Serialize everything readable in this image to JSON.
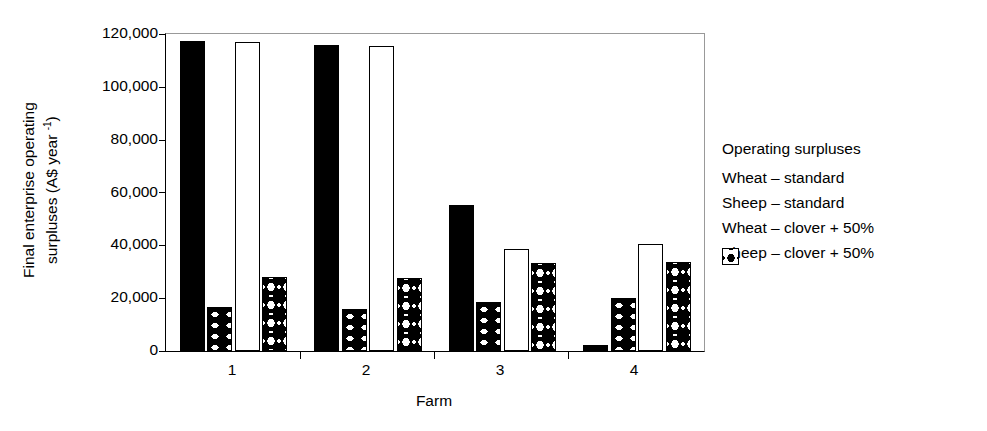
{
  "chart_data": {
    "type": "bar",
    "title": "",
    "xlabel": "Farm",
    "ylabel_line1": "Final enterprise operating",
    "ylabel_line2": "surpluses (A$ year ",
    "ylabel_sup": "-1",
    "ylabel_line2_end": ")",
    "categories": [
      "1",
      "2",
      "3",
      "4"
    ],
    "ylim": [
      0,
      120000
    ],
    "yticks": [
      0,
      20000,
      40000,
      60000,
      80000,
      100000,
      120000
    ],
    "ytick_labels": [
      "0",
      "20,000",
      "40,000",
      "60,000",
      "80,000",
      "100,000",
      "120,000"
    ],
    "grid": false,
    "legend_position": "right",
    "legend_title": "Operating surpluses",
    "series": [
      {
        "name": "Wheat – standard",
        "pattern": "solid-black",
        "values": [
          117500,
          116000,
          55200,
          2200
        ]
      },
      {
        "name": "Sheep – standard",
        "pattern": "wave-hatch",
        "values": [
          16500,
          15800,
          18600,
          20200
        ]
      },
      {
        "name": "Wheat – clover + 50%",
        "pattern": "open-white",
        "values": [
          117000,
          115500,
          38500,
          40500
        ]
      },
      {
        "name": "Sheep – clover + 50%",
        "pattern": "diamond-hatch",
        "values": [
          28000,
          27800,
          33200,
          33700
        ]
      }
    ]
  },
  "colors": {
    "ink": "#000000",
    "background": "#ffffff",
    "frame_light": "#999999"
  }
}
